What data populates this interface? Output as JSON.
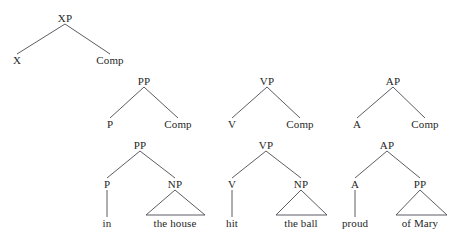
{
  "figure": {
    "background_color": "#ffffff",
    "line_color": "#4a4a52",
    "text_color": "#272727"
  },
  "trees": [
    {
      "id": "schema-xp",
      "name": "xp-schema-tree",
      "nodes": [
        {
          "id": "xp-root",
          "label": "XP",
          "x": 65,
          "y": 18,
          "type": "nonterminal"
        },
        {
          "id": "xp-head",
          "label": "X",
          "x": 17,
          "y": 60,
          "type": "nonterminal"
        },
        {
          "id": "xp-comp",
          "label": "Comp",
          "x": 110,
          "y": 60,
          "type": "nonterminal"
        }
      ],
      "edges": [
        {
          "from": "xp-root",
          "to": "xp-head"
        },
        {
          "from": "xp-root",
          "to": "xp-comp"
        }
      ],
      "triangles": []
    },
    {
      "id": "schema-pp",
      "name": "pp-schema-tree",
      "nodes": [
        {
          "id": "pp2-root",
          "label": "PP",
          "x": 144,
          "y": 81,
          "type": "nonterminal"
        },
        {
          "id": "pp2-head",
          "label": "P",
          "x": 110,
          "y": 124,
          "type": "nonterminal"
        },
        {
          "id": "pp2-comp",
          "label": "Comp",
          "x": 178,
          "y": 124,
          "type": "nonterminal"
        }
      ],
      "edges": [
        {
          "from": "pp2-root",
          "to": "pp2-head"
        },
        {
          "from": "pp2-root",
          "to": "pp2-comp"
        }
      ],
      "triangles": []
    },
    {
      "id": "schema-vp",
      "name": "vp-schema-tree",
      "nodes": [
        {
          "id": "vp2-root",
          "label": "VP",
          "x": 267,
          "y": 81,
          "type": "nonterminal"
        },
        {
          "id": "vp2-head",
          "label": "V",
          "x": 232,
          "y": 124,
          "type": "nonterminal"
        },
        {
          "id": "vp2-comp",
          "label": "Comp",
          "x": 300,
          "y": 124,
          "type": "nonterminal"
        }
      ],
      "edges": [
        {
          "from": "vp2-root",
          "to": "vp2-head"
        },
        {
          "from": "vp2-root",
          "to": "vp2-comp"
        }
      ],
      "triangles": []
    },
    {
      "id": "schema-ap",
      "name": "ap-schema-tree",
      "nodes": [
        {
          "id": "ap2-root",
          "label": "AP",
          "x": 393,
          "y": 81,
          "type": "nonterminal"
        },
        {
          "id": "ap2-head",
          "label": "A",
          "x": 357,
          "y": 124,
          "type": "nonterminal"
        },
        {
          "id": "ap2-comp",
          "label": "Comp",
          "x": 425,
          "y": 124,
          "type": "nonterminal"
        }
      ],
      "edges": [
        {
          "from": "ap2-root",
          "to": "ap2-head"
        },
        {
          "from": "ap2-root",
          "to": "ap2-comp"
        }
      ],
      "triangles": []
    },
    {
      "id": "example-pp",
      "name": "pp-example-tree",
      "nodes": [
        {
          "id": "pp3-root",
          "label": "PP",
          "x": 140,
          "y": 145,
          "type": "nonterminal"
        },
        {
          "id": "pp3-head",
          "label": "P",
          "x": 107,
          "y": 184,
          "type": "nonterminal"
        },
        {
          "id": "pp3-np",
          "label": "NP",
          "x": 175,
          "y": 184,
          "type": "nonterminal"
        },
        {
          "id": "pp3-in",
          "label": "in",
          "x": 107,
          "y": 223,
          "type": "terminal"
        },
        {
          "id": "pp3-thehouse",
          "label": "the house",
          "x": 175,
          "y": 223,
          "type": "terminal"
        }
      ],
      "edges": [
        {
          "from": "pp3-root",
          "to": "pp3-head"
        },
        {
          "from": "pp3-root",
          "to": "pp3-np"
        },
        {
          "from": "pp3-head",
          "to": "pp3-in"
        }
      ],
      "triangles": [
        {
          "apex": "pp3-np",
          "base_left_x": 146,
          "base_right_x": 205,
          "base_y": 215
        }
      ]
    },
    {
      "id": "example-vp",
      "name": "vp-example-tree",
      "nodes": [
        {
          "id": "vp3-root",
          "label": "VP",
          "x": 266,
          "y": 145,
          "type": "nonterminal"
        },
        {
          "id": "vp3-head",
          "label": "V",
          "x": 232,
          "y": 184,
          "type": "nonterminal"
        },
        {
          "id": "vp3-np",
          "label": "NP",
          "x": 301,
          "y": 184,
          "type": "nonterminal"
        },
        {
          "id": "vp3-hit",
          "label": "hit",
          "x": 232,
          "y": 223,
          "type": "terminal"
        },
        {
          "id": "vp3-theball",
          "label": "the ball",
          "x": 301,
          "y": 223,
          "type": "terminal"
        }
      ],
      "edges": [
        {
          "from": "vp3-root",
          "to": "vp3-head"
        },
        {
          "from": "vp3-root",
          "to": "vp3-np"
        },
        {
          "from": "vp3-head",
          "to": "vp3-hit"
        }
      ],
      "triangles": [
        {
          "apex": "vp3-np",
          "base_left_x": 276,
          "base_right_x": 327,
          "base_y": 215
        }
      ]
    },
    {
      "id": "example-ap",
      "name": "ap-example-tree",
      "nodes": [
        {
          "id": "ap3-root",
          "label": "AP",
          "x": 387,
          "y": 145,
          "type": "nonterminal"
        },
        {
          "id": "ap3-head",
          "label": "A",
          "x": 355,
          "y": 184,
          "type": "nonterminal"
        },
        {
          "id": "ap3-pp",
          "label": "PP",
          "x": 420,
          "y": 184,
          "type": "nonterminal"
        },
        {
          "id": "ap3-proud",
          "label": "proud",
          "x": 355,
          "y": 223,
          "type": "terminal"
        },
        {
          "id": "ap3-ofmary",
          "label": "of Mary",
          "x": 420,
          "y": 223,
          "type": "terminal"
        }
      ],
      "edges": [
        {
          "from": "ap3-root",
          "to": "ap3-head"
        },
        {
          "from": "ap3-root",
          "to": "ap3-pp"
        },
        {
          "from": "ap3-head",
          "to": "ap3-proud"
        }
      ],
      "triangles": [
        {
          "apex": "ap3-pp",
          "base_left_x": 396,
          "base_right_x": 447,
          "base_y": 215
        }
      ]
    }
  ]
}
